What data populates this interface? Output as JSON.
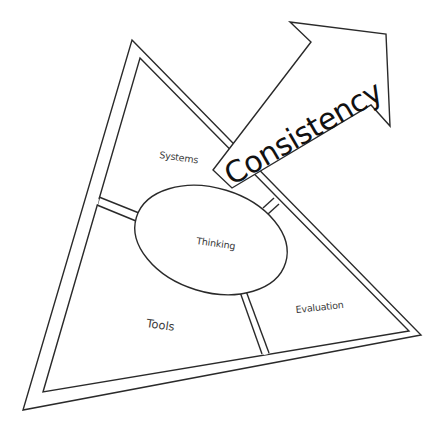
{
  "diagram": {
    "type": "triangle-with-arrow",
    "sections": {
      "top": {
        "label": "Systems"
      },
      "center": {
        "label": "Thinking"
      },
      "bottom_left": {
        "label": "Tools"
      },
      "bottom_right": {
        "label": "Evaluation"
      }
    },
    "arrow": {
      "label": "Consistency"
    },
    "colors": {
      "line": "#2a2a2a",
      "text": "#3a3a3a",
      "arrow_text": "#111111",
      "background": "#ffffff"
    }
  }
}
